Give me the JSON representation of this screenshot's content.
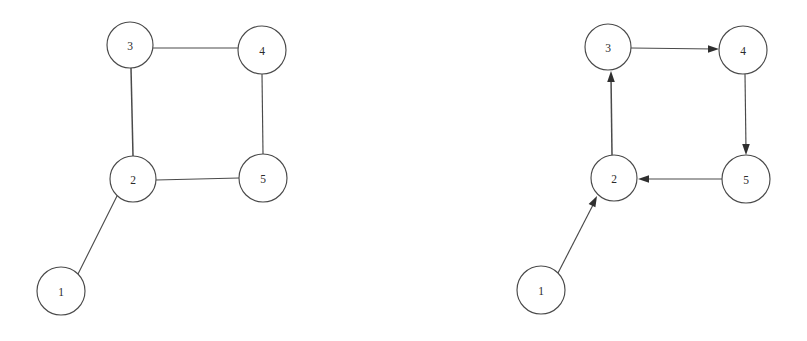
{
  "figure": {
    "background_color": "#ffffff",
    "stroke_color": "#4a4a4a",
    "label_color": "#2b2b2b",
    "arrow_color": "#2f2f2f",
    "width": 807,
    "height": 341
  },
  "graphs": [
    {
      "id": "left-graph",
      "name": "undirected-graph",
      "directed": false,
      "nodes": [
        {
          "id": "L1",
          "label": "1",
          "cx": 61,
          "cy": 291,
          "r": 24
        },
        {
          "id": "L2",
          "label": "2",
          "cx": 133,
          "cy": 179,
          "r": 23
        },
        {
          "id": "L3",
          "label": "3",
          "cx": 130,
          "cy": 45,
          "r": 23
        },
        {
          "id": "L4",
          "label": "4",
          "cx": 262,
          "cy": 50,
          "r": 24
        },
        {
          "id": "L5",
          "label": "5",
          "cx": 263,
          "cy": 178,
          "r": 24
        }
      ],
      "edges": [
        {
          "id": "L-3-4",
          "from": "3",
          "to": "4",
          "x1": 153,
          "y1": 48,
          "x2": 238,
          "y2": 48
        },
        {
          "id": "L-3-2",
          "from": "3",
          "to": "2",
          "x1": 131,
          "y1": 68,
          "x2": 133,
          "y2": 156
        },
        {
          "id": "L-4-5",
          "from": "4",
          "to": "5",
          "x1": 262,
          "y1": 74,
          "x2": 263,
          "y2": 154
        },
        {
          "id": "L-2-5",
          "from": "2",
          "to": "5",
          "x1": 156,
          "y1": 180,
          "x2": 239,
          "y2": 178
        },
        {
          "id": "L-1-2",
          "from": "1",
          "to": "2",
          "x1": 78,
          "y1": 274,
          "x2": 117,
          "y2": 196
        }
      ]
    },
    {
      "id": "right-graph",
      "name": "directed-graph",
      "directed": true,
      "nodes": [
        {
          "id": "R1",
          "label": "1",
          "cx": 541,
          "cy": 290,
          "r": 24
        },
        {
          "id": "R2",
          "label": "2",
          "cx": 614,
          "cy": 178,
          "r": 23
        },
        {
          "id": "R3",
          "label": "3",
          "cx": 608,
          "cy": 47,
          "r": 23
        },
        {
          "id": "R4",
          "label": "4",
          "cx": 743,
          "cy": 50,
          "r": 24
        },
        {
          "id": "R5",
          "label": "5",
          "cx": 746,
          "cy": 179,
          "r": 24
        }
      ],
      "edges": [
        {
          "id": "R-3-4",
          "from": "3",
          "to": "4",
          "x1": 631,
          "y1": 48,
          "x2": 719,
          "y2": 49,
          "arrow": true
        },
        {
          "id": "R-4-5",
          "from": "4",
          "to": "5",
          "x1": 745,
          "y1": 74,
          "x2": 746,
          "y2": 155,
          "arrow": true
        },
        {
          "id": "R-5-2",
          "from": "5",
          "to": "2",
          "x1": 722,
          "y1": 179,
          "x2": 638,
          "y2": 179,
          "arrow": true
        },
        {
          "id": "R-2-3",
          "from": "2",
          "to": "3",
          "x1": 612,
          "y1": 155,
          "x2": 611,
          "y2": 71,
          "arrow": true
        },
        {
          "id": "R-1-2",
          "from": "1",
          "to": "2",
          "x1": 558,
          "y1": 273,
          "x2": 597,
          "y2": 196,
          "arrow": true
        }
      ]
    }
  ]
}
